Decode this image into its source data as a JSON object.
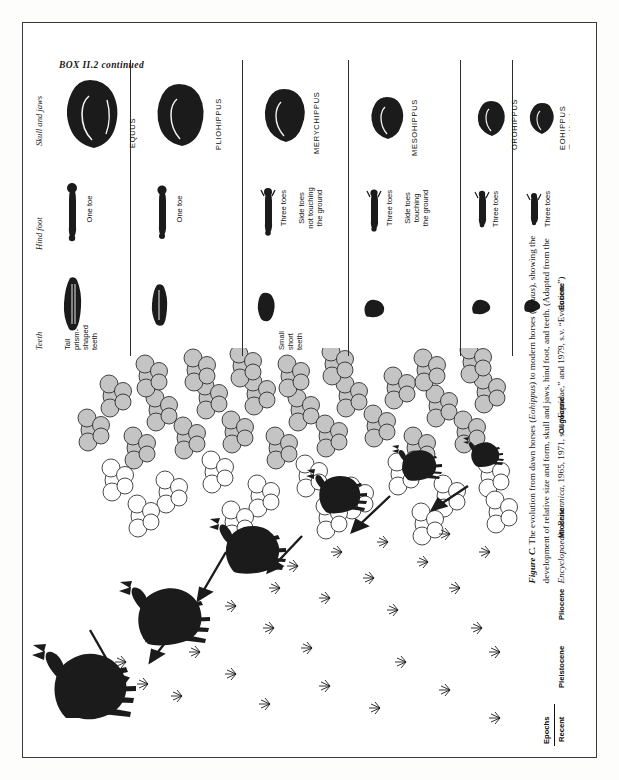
{
  "box": {
    "header": "BOX II.2  continued"
  },
  "table": {
    "column_headers": [
      {
        "key": "teeth",
        "label": "Teeth"
      },
      {
        "key": "hind_foot",
        "label": "Hind foot"
      },
      {
        "key": "skull_and_jaws",
        "label": "Skull and jaws"
      }
    ],
    "rows": [
      {
        "genus": "EQUUS",
        "genus_sub": "",
        "teeth_note": "",
        "foot_note": "One toe"
      },
      {
        "genus": "PLIOHIPPUS",
        "genus_sub": "",
        "teeth_note": "Tall\nprism-\nshaped\nteeth",
        "foot_note": "One toe"
      },
      {
        "genus": "MERYCHIPPUS",
        "genus_sub": "",
        "teeth_note": "",
        "foot_note": "Three toes\n\nSide toes\nnot touching\nthe ground"
      },
      {
        "genus": "MESOHIPPUS",
        "genus_sub": "",
        "teeth_note": "Small\nshort\nteeth",
        "foot_note": "Three toes\n\nSide toes\ntouching\nthe ground"
      },
      {
        "genus": "OROHIPPUS",
        "genus_sub": "",
        "teeth_note": "",
        "foot_note": "Three toes"
      },
      {
        "genus": "EOHIPPUS",
        "genus_sub": "(Dawn Horse)",
        "teeth_note": "",
        "foot_note": "Three toes"
      }
    ]
  },
  "epochs": {
    "title": "Epochs",
    "items": [
      {
        "label": "Recent"
      },
      {
        "label": "Pleistocene"
      },
      {
        "label": "Pliocene"
      },
      {
        "label": "Miocene"
      },
      {
        "label": "Oligocene"
      },
      {
        "label": "Eocene"
      }
    ]
  },
  "caption": {
    "figure_label": "Figure C.",
    "line1": "The evolution from dawn horses (",
    "genus_italic_1": "Eohippus",
    "line2": ") to modern horses (",
    "genus_italic_2": "Equus",
    "line3": "), showing the development of relative size and form, skull and jaws, hind foot, and teeth. (Adapted from the ",
    "source_italic": "Encyclopaedia Britannica",
    "line4": ", 1965, 1971, s.v. “Equidae,” and 1979, s.v. “Evolution.”)",
    "full_text": "Figure C. The evolution from dawn horses (Eohippus) to modern horses (Equus), showing the development of relative size and form, skull and jaws, hind foot, and teeth. (Adapted from the Encyclopaedia Britannica, 1965, 1971, s.v. “Equidae,” and 1979, s.v. “Evolution.”)"
  },
  "colors": {
    "ink": "#1b1b1b",
    "rule": "#2c2c2c",
    "foliage_fill": "#b9b9b9",
    "paper": "#ffffff"
  },
  "scene": {
    "description": "Ink illustration of six horse ancestors in a landscape with grasses and leafy trees, connected by arrows showing the evolutionary progression"
  }
}
